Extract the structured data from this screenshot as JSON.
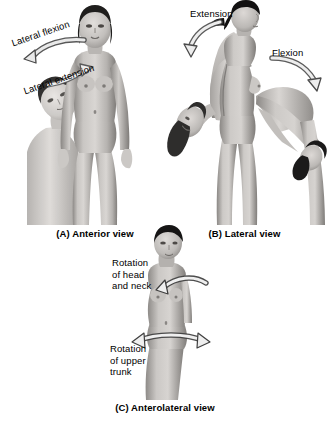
{
  "figure": {
    "background_color": "#ffffff",
    "ink_color": "#000000",
    "arrow_fill": "#f2f2f2",
    "arrow_stroke": "#3a3a3a",
    "skin_light": "#d8d5d2",
    "skin_mid": "#a8a5a2",
    "skin_dark": "#6f6d6b",
    "hair_color": "#1c1b1b"
  },
  "panels": [
    {
      "id": "a",
      "caption": "(A) Anterior view",
      "view_name": "anterior",
      "labels": [
        {
          "id": "lateral-flexion",
          "text": "Lateral flexion",
          "rotated": true
        },
        {
          "id": "lateral-extension",
          "text": "Lateral extension",
          "rotated": true
        }
      ],
      "arrows": [
        {
          "id": "lateral-flexion-arrow",
          "direction": "down-left",
          "style": "curved-outline"
        },
        {
          "id": "lateral-extension-arrow",
          "direction": "up-right",
          "style": "curved-outline"
        }
      ],
      "figures": [
        "head-tilted-lateral",
        "body-upright-anterior"
      ]
    },
    {
      "id": "b",
      "caption": "(B) Lateral view",
      "view_name": "lateral",
      "labels": [
        {
          "id": "extension",
          "text": "Extension",
          "rotated": false
        },
        {
          "id": "flexion",
          "text": "Flexion",
          "rotated": false
        }
      ],
      "arrows": [
        {
          "id": "extension-arrow",
          "direction": "down-left",
          "style": "curved-outline"
        },
        {
          "id": "flexion-arrow",
          "direction": "down-right",
          "style": "curved-outline"
        }
      ],
      "figures": [
        "body-arched-backward",
        "body-upright-lateral",
        "body-bent-forward"
      ]
    },
    {
      "id": "c",
      "caption": "(C) Anterolateral view",
      "view_name": "anterolateral",
      "labels": [
        {
          "id": "rotation-head-neck",
          "text": "Rotation\nof head\nand neck",
          "rotated": false
        },
        {
          "id": "rotation-upper-trunk",
          "text": "Rotation\nof upper\ntrunk",
          "rotated": false
        }
      ],
      "arrows": [
        {
          "id": "rotation-head-neck-arrow",
          "direction": "around-head",
          "style": "curved-outline-double"
        },
        {
          "id": "rotation-upper-trunk-arrow",
          "direction": "around-trunk",
          "style": "curved-outline-double"
        }
      ],
      "figures": [
        "body-anterolateral-rotating"
      ]
    }
  ]
}
